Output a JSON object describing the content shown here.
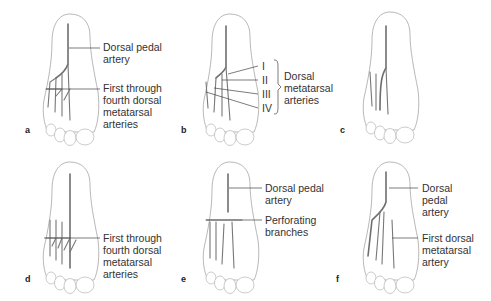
{
  "figure": {
    "panels": [
      {
        "id": "a",
        "letter": "a",
        "labels": [
          "Dorsal pedal",
          "artery",
          "First through",
          "fourth dorsal",
          "metatarsal",
          "arteries"
        ]
      },
      {
        "id": "b",
        "letter": "b",
        "roman": [
          "I",
          "II",
          "III",
          "IV"
        ],
        "labels": [
          "Dorsal",
          "metatarsal",
          "arteries"
        ]
      },
      {
        "id": "c",
        "letter": "c",
        "labels": []
      },
      {
        "id": "d",
        "letter": "d",
        "labels": [
          "First through",
          "fourth dorsal",
          "metatarsal",
          "arteries"
        ]
      },
      {
        "id": "e",
        "letter": "e",
        "labels": [
          "Dorsal pedal",
          "artery",
          "Perforating",
          "branches"
        ]
      },
      {
        "id": "f",
        "letter": "f",
        "labels": [
          "Dorsal",
          "pedal",
          "artery",
          "First dorsal",
          "metatarsal",
          "artery"
        ]
      }
    ]
  }
}
